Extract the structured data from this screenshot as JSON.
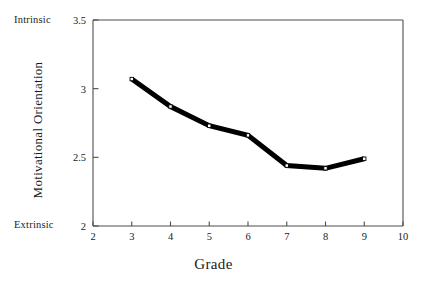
{
  "chart_data": {
    "type": "line",
    "title": "",
    "xlabel": "Grade",
    "ylabel": "Motivational Orientation",
    "x": [
      3,
      4,
      5,
      6,
      7,
      8,
      9
    ],
    "values": [
      3.07,
      2.87,
      2.73,
      2.66,
      2.44,
      2.42,
      2.49
    ],
    "categories": [
      "3",
      "4",
      "5",
      "6",
      "7",
      "8",
      "9"
    ],
    "series": [
      {
        "name": "Motivational Orientation",
        "values": [
          3.07,
          2.87,
          2.73,
          2.66,
          2.44,
          2.42,
          2.49
        ]
      }
    ],
    "xlim": [
      2,
      10
    ],
    "ylim": [
      2,
      3.5
    ],
    "xticks": [
      "2",
      "3",
      "4",
      "5",
      "6",
      "7",
      "8",
      "9",
      "10"
    ],
    "xtick_values": [
      2,
      3,
      4,
      5,
      6,
      7,
      8,
      9,
      10
    ],
    "yticks": [
      "2",
      "2.5",
      "3",
      "3.5"
    ],
    "ytick_values": [
      2,
      2.5,
      3,
      3.5
    ],
    "grid": false,
    "legend": "none",
    "annotations": {
      "y_axis_top_anchor": "Intrinsic",
      "y_axis_bottom_anchor": "Extrinsic"
    },
    "style": {
      "line_color": "#000000",
      "line_width": 5,
      "marker": "square-open",
      "marker_face_color": "#ffffff",
      "marker_edge_color": "#000000",
      "axis_color": "#4d4d4d",
      "background": "#ffffff"
    }
  },
  "axis_titles": {
    "x": "Grade",
    "y": "Motivational Orientation"
  },
  "anchors": {
    "top": "Intrinsic",
    "bottom": "Extrinsic"
  }
}
